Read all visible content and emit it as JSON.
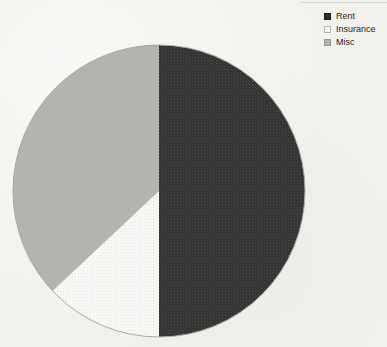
{
  "page": {
    "background_color": "#f2f1ed",
    "title": ""
  },
  "legend": {
    "position": "top-right",
    "items": [
      {
        "label": "Rent",
        "swatch_color": "#2f2f2f",
        "swatch_border": "#1a1a1a"
      },
      {
        "label": "Insurance",
        "swatch_color": "#f8f8f5",
        "swatch_border": "#b3b2af"
      },
      {
        "label": "Misc",
        "swatch_color": "#b4b3b0",
        "swatch_border": "#96958f"
      }
    ]
  },
  "chart_data": {
    "type": "pie",
    "title": "",
    "categories": [
      "Rent",
      "Insurance",
      "Misc"
    ],
    "values": [
      50,
      13,
      37
    ],
    "unit": "percent (estimated from slice angles; no data labels shown)",
    "start_angle_deg": 0,
    "direction": "clockwise",
    "legend_position": "top-right",
    "outline_color": "#a9a8a4",
    "series_styles": [
      {
        "label": "Rent",
        "fill": "dark-dot-pattern",
        "color": "#353535"
      },
      {
        "label": "Insurance",
        "fill": "light-dot-pattern",
        "color": "#f8f8f5"
      },
      {
        "label": "Misc",
        "fill": "solid",
        "color": "#b4b3b0"
      }
    ]
  }
}
